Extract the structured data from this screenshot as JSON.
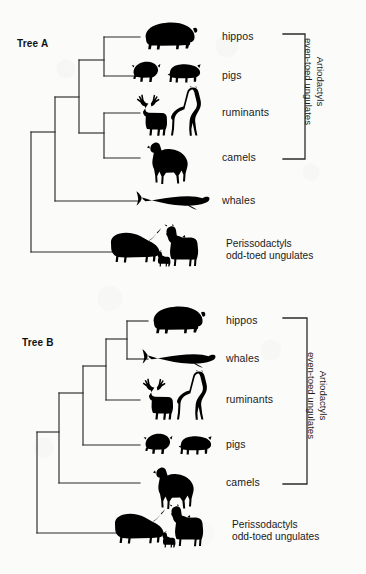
{
  "figure": {
    "background_color": "#fbfbfa",
    "line_color": "#2b2b2b",
    "silhouette_color": "#000000"
  },
  "trees": [
    {
      "id": "tree-a",
      "label": "Tree A",
      "topology": "(((hippos,pigs),(ruminants,camels)),whales),Perissodactyls",
      "tips": [
        {
          "key": "hippos",
          "label": "hippos",
          "silhouettes": [
            "hippopotamus"
          ]
        },
        {
          "key": "pigs",
          "label": "pigs",
          "silhouettes": [
            "boar",
            "pig"
          ]
        },
        {
          "key": "ruminants",
          "label": "ruminants",
          "silhouettes": [
            "deer",
            "giraffe"
          ]
        },
        {
          "key": "camels",
          "label": "camels",
          "silhouettes": [
            "camel"
          ]
        },
        {
          "key": "whales",
          "label": "whales",
          "silhouettes": [
            "whale"
          ]
        },
        {
          "key": "perissodactyls",
          "label": "",
          "silhouettes": [
            "rhinoceros",
            "zebra",
            "foal"
          ]
        }
      ],
      "bracket_label": {
        "line1": "Artiodactyls",
        "line2": "even-toed ungulates",
        "spans": [
          "hippos",
          "camels"
        ]
      },
      "outgroup_label": {
        "line1": "Perissodactyls",
        "line2": "odd-toed ungulates"
      }
    },
    {
      "id": "tree-b",
      "label": "Tree B",
      "topology": "((((hippos,whales),ruminants),pigs),camels),Perissodactyls",
      "tips": [
        {
          "key": "hippos",
          "label": "hippos",
          "silhouettes": [
            "hippopotamus"
          ]
        },
        {
          "key": "whales",
          "label": "whales",
          "silhouettes": [
            "whale"
          ]
        },
        {
          "key": "ruminants",
          "label": "ruminants",
          "silhouettes": [
            "deer",
            "giraffe"
          ]
        },
        {
          "key": "pigs",
          "label": "pigs",
          "silhouettes": [
            "boar",
            "pig"
          ]
        },
        {
          "key": "camels",
          "label": "camels",
          "silhouettes": [
            "camel"
          ]
        },
        {
          "key": "perissodactyls",
          "label": "",
          "silhouettes": [
            "rhinoceros",
            "zebra",
            "foal"
          ]
        }
      ],
      "bracket_label": {
        "line1": "Artiodactyls",
        "line2": "even-toed ungulates",
        "spans": [
          "hippos",
          "camels"
        ]
      },
      "outgroup_label": {
        "line1": "Perissodactyls",
        "line2": "odd-toed ungulates"
      }
    }
  ]
}
